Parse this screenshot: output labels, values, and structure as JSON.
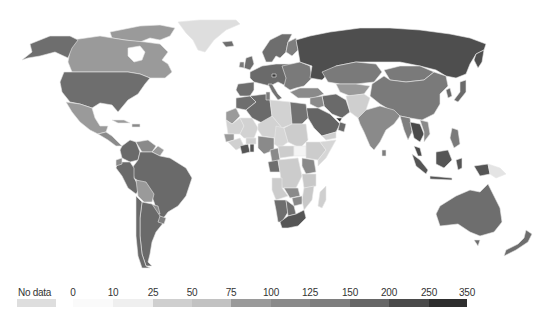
{
  "map": {
    "type": "choropleth-world",
    "colormap": "greyscale",
    "title_visible": false
  },
  "legend": {
    "no_data": {
      "label": "No data",
      "color": "#dedede"
    },
    "ticks": [
      "0",
      "10",
      "25",
      "50",
      "75",
      "100",
      "125",
      "150",
      "200",
      "250",
      "350"
    ],
    "bins": [
      {
        "from": "0",
        "to": "10",
        "color": "#fafafa"
      },
      {
        "from": "10",
        "to": "25",
        "color": "#efefef"
      },
      {
        "from": "25",
        "to": "50",
        "color": "#cfcfcf"
      },
      {
        "from": "50",
        "to": "75",
        "color": "#c2c2c2"
      },
      {
        "from": "75",
        "to": "100",
        "color": "#9a9a9a"
      },
      {
        "from": "100",
        "to": "125",
        "color": "#8a8a8a"
      },
      {
        "from": "125",
        "to": "150",
        "color": "#7e7e7e"
      },
      {
        "from": "150",
        "to": "200",
        "color": "#666666"
      },
      {
        "from": "200",
        "to": "250",
        "color": "#4a4a4a"
      },
      {
        "from": "250",
        "to": "350",
        "color": "#2e2e2e"
      }
    ]
  },
  "regions": [
    {
      "name": "Greenland",
      "bin": "no_data",
      "color": "#dedede"
    },
    {
      "name": "Canada",
      "bin": "75-100",
      "color": "#9a9a9a"
    },
    {
      "name": "Alaska/USA",
      "bin": "150-200",
      "color": "#6e6e6e"
    },
    {
      "name": "United States",
      "bin": "150-200",
      "color": "#6e6e6e"
    },
    {
      "name": "Mexico",
      "bin": "75-100",
      "color": "#9a9a9a"
    },
    {
      "name": "Central America",
      "bin": "100-125",
      "color": "#8a8a8a"
    },
    {
      "name": "Colombia/Venezuela",
      "bin": "125-150",
      "color": "#7e7e7e"
    },
    {
      "name": "Brazil",
      "bin": "150-200",
      "color": "#6a6a6a"
    },
    {
      "name": "Peru",
      "bin": "150-200",
      "color": "#6a6a6a"
    },
    {
      "name": "Bolivia",
      "bin": "75-100",
      "color": "#9a9a9a"
    },
    {
      "name": "Argentina",
      "bin": "150-200",
      "color": "#6a6a6a"
    },
    {
      "name": "Chile",
      "bin": "150-200",
      "color": "#6a6a6a"
    },
    {
      "name": "Europe",
      "bin": "150-200",
      "color": "#6e6e6e"
    },
    {
      "name": "Russia",
      "bin": "200-250",
      "color": "#4e4e4e"
    },
    {
      "name": "Kazakhstan",
      "bin": "125-150",
      "color": "#7a7a7a"
    },
    {
      "name": "Mongolia",
      "bin": "125-150",
      "color": "#7a7a7a"
    },
    {
      "name": "China",
      "bin": "125-150",
      "color": "#7a7a7a"
    },
    {
      "name": "India",
      "bin": "100-125",
      "color": "#8a8a8a"
    },
    {
      "name": "Iran",
      "bin": "150-200",
      "color": "#6a6a6a"
    },
    {
      "name": "Saudi Arabia",
      "bin": "150-200",
      "color": "#646464"
    },
    {
      "name": "Afghanistan/Pakistan",
      "bin": "25-50",
      "color": "#cfcfcf"
    },
    {
      "name": "Southeast Asia",
      "bin": "200-250",
      "color": "#555555"
    },
    {
      "name": "Indonesia",
      "bin": "200-250",
      "color": "#555555"
    },
    {
      "name": "Papua New Guinea",
      "bin": "10-25",
      "color": "#e4e4e4"
    },
    {
      "name": "Australia",
      "bin": "150-200",
      "color": "#6e6e6e"
    },
    {
      "name": "New Zealand",
      "bin": "150-200",
      "color": "#6e6e6e"
    },
    {
      "name": "Japan",
      "bin": "150-200",
      "color": "#6a6a6a"
    },
    {
      "name": "North Africa",
      "bin": "150-200",
      "color": "#6a6a6a"
    },
    {
      "name": "Sahel",
      "bin": "25-50",
      "color": "#d2d2d2"
    },
    {
      "name": "Egypt",
      "bin": "150-200",
      "color": "#727272"
    },
    {
      "name": "Central Africa",
      "bin": "25-50",
      "color": "#cccccc"
    },
    {
      "name": "East Africa",
      "bin": "25-50",
      "color": "#c8c8c8"
    },
    {
      "name": "Southern Africa",
      "bin": "100-125",
      "color": "#888888"
    },
    {
      "name": "South Africa",
      "bin": "200-250",
      "color": "#555555"
    },
    {
      "name": "Madagascar",
      "bin": "25-50",
      "color": "#cfcfcf"
    }
  ]
}
